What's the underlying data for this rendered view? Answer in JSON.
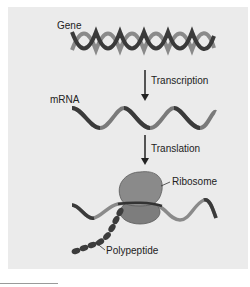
{
  "diagram": {
    "labels": {
      "gene": "Gene",
      "mrna": "mRNA",
      "ribosome": "Ribosome",
      "polypeptide": "Polypeptide"
    },
    "steps": [
      {
        "label": "Transcription",
        "from": "Gene",
        "to": "mRNA"
      },
      {
        "label": "Translation",
        "from": "mRNA",
        "to": "Ribosome"
      }
    ],
    "colors": {
      "background": "#ebebeb",
      "strand_dark": "#3a3a3a",
      "strand_light": "#8a8a8a",
      "ribosome": "#7d7d7d",
      "polypeptide": "#3c3c3c",
      "arrow": "#222222"
    }
  }
}
